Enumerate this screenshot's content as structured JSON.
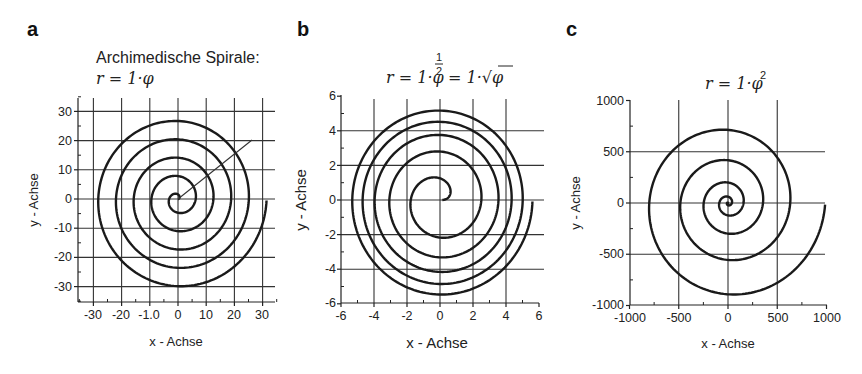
{
  "panels": {
    "a": {
      "letter": "a",
      "title": "Archimedische Spirale:",
      "formula": "r = 1·φ",
      "xlabel": "x - Achse",
      "ylabel": "y - Achse",
      "xticks": [
        "-30",
        "-20",
        "-1.0",
        "0",
        "10",
        "20",
        "30"
      ],
      "yticks": [
        "30",
        "20",
        "10",
        "0",
        "-10",
        "-20",
        "-30"
      ]
    },
    "b": {
      "letter": "b",
      "formula_left": "r = 1·φ",
      "formula_exp": "1/2",
      "formula_right": "= 1·√φ",
      "xlabel": "x - Achse",
      "ylabel": "y - Achse",
      "xticks": [
        "-6",
        "-4",
        "-2",
        "0",
        "2",
        "4",
        "6"
      ],
      "yticks": [
        "6",
        "4",
        "2",
        "0",
        "-2",
        "-4",
        "-6"
      ]
    },
    "c": {
      "letter": "c",
      "formula": "r = 1·φ",
      "formula_exp": "2",
      "xlabel": "x - Achse",
      "ylabel": "y - Achse",
      "xticks": [
        "-1000",
        "-500",
        "0",
        "500",
        "1000"
      ],
      "yticks": [
        "1000",
        "500",
        "0",
        "-500",
        "-1000"
      ]
    }
  },
  "chart_data": [
    {
      "type": "line",
      "panel": "a",
      "title": "Archimedische Spirale: r = 1·φ",
      "equation": "r = 1·φ",
      "xlabel": "x - Achse",
      "ylabel": "y - Achse",
      "xlim": [
        -35,
        35
      ],
      "ylim": [
        -35,
        35
      ],
      "xticks": [
        -30,
        -20,
        -10,
        0,
        10,
        20,
        30
      ],
      "yticks": [
        30,
        20,
        10,
        0,
        -10,
        -20,
        -30
      ],
      "grid": true,
      "phi_range": [
        0,
        31.4
      ],
      "turns": 5,
      "end_point": [
        31.4,
        0
      ],
      "annotation": "radial line from origin to approx (21, 20)"
    },
    {
      "type": "line",
      "panel": "b",
      "title": "r = 1·φ^(1/2) = 1·√φ",
      "equation": "r = sqrt(φ)",
      "xlabel": "x - Achse",
      "ylabel": "y - Achse",
      "xlim": [
        -6,
        6
      ],
      "ylim": [
        -6,
        6
      ],
      "xticks": [
        -6,
        -4,
        -2,
        0,
        2,
        4,
        6
      ],
      "yticks": [
        6,
        4,
        2,
        0,
        -2,
        -4,
        -6
      ],
      "grid": true,
      "phi_range": [
        0,
        31.4
      ],
      "turns": 5,
      "end_point": [
        5.6,
        0
      ]
    },
    {
      "type": "line",
      "panel": "c",
      "title": "r = 1·φ^2",
      "equation": "r = φ^2",
      "xlabel": "x - Achse",
      "ylabel": "y - Achse",
      "xlim": [
        -1000,
        1000
      ],
      "ylim": [
        -1000,
        1000
      ],
      "xticks": [
        -1000,
        -500,
        0,
        500,
        1000
      ],
      "yticks": [
        1000,
        500,
        0,
        -500,
        -1000
      ],
      "grid": true,
      "phi_range": [
        0,
        31.4
      ],
      "turns": 5,
      "end_point": [
        986,
        0
      ]
    }
  ]
}
